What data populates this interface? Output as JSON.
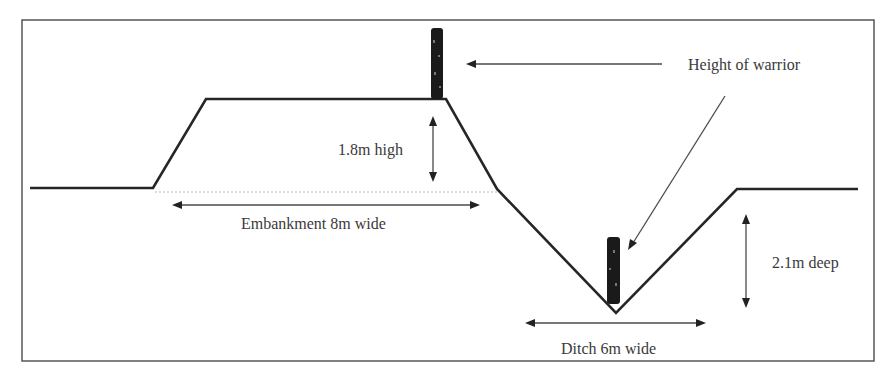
{
  "diagram": {
    "title_hidden": "",
    "labels": {
      "warrior_height": "Height of warrior",
      "embankment_height": "1.8m high",
      "embankment_width": "Embankment 8m wide",
      "ditch_depth": "2.1m deep",
      "ditch_width": "Ditch 6m wide"
    },
    "measurements": {
      "embankment_height_m": 1.8,
      "embankment_width_m": 8,
      "ditch_depth_m": 2.1,
      "ditch_width_m": 6
    },
    "figures": [
      {
        "name": "warrior-on-embankment",
        "position": "embankment top"
      },
      {
        "name": "warrior-in-ditch",
        "position": "ditch bottom"
      }
    ],
    "colors": {
      "line": "#262626",
      "text": "#3a3a3a",
      "background": "#ffffff"
    }
  }
}
